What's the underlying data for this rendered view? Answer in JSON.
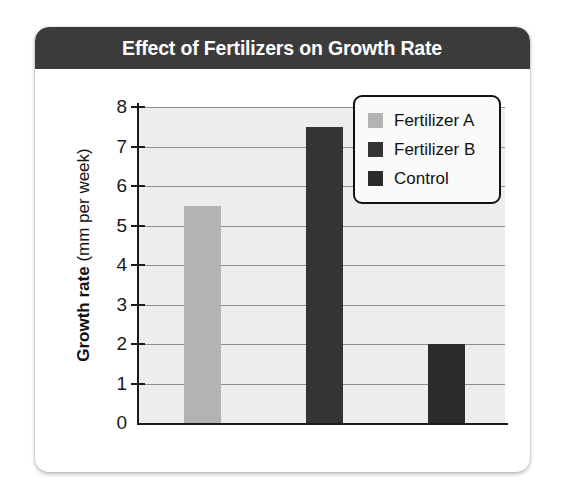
{
  "card": {
    "title": "Effect of Fertilizers on Growth Rate",
    "header_bg": "#3b3b3b",
    "title_color": "#ffffff",
    "card_bg": "#ffffff"
  },
  "chart_data": {
    "type": "bar",
    "title": "Effect of Fertilizers on Growth Rate",
    "xlabel": "",
    "ylabel": "Growth rate (mm per week)",
    "ylabel_bold_part": "Growth rate",
    "ylabel_light_part": "(mm per week)",
    "categories": [
      "Fertilizer A",
      "Fertilizer B",
      "Control"
    ],
    "values": [
      5.5,
      7.5,
      2.0
    ],
    "colors": [
      "#b3b3b3",
      "#343434",
      "#2b2b2b"
    ],
    "ylim": [
      0,
      8
    ],
    "yticks": [
      0,
      1,
      2,
      3,
      4,
      5,
      6,
      7,
      8
    ],
    "ytick_labels": [
      "0",
      "1",
      "2",
      "3",
      "4",
      "5",
      "6",
      "7",
      "8"
    ],
    "grid": true,
    "grid_color": "#8e8e8e",
    "plot_bg": "#ededed",
    "legend_position": "upper right",
    "legend": [
      {
        "label": "Fertilizer A",
        "color": "#b3b3b3"
      },
      {
        "label": "Fertilizer B",
        "color": "#343434"
      },
      {
        "label": "Control",
        "color": "#2b2b2b"
      }
    ]
  }
}
